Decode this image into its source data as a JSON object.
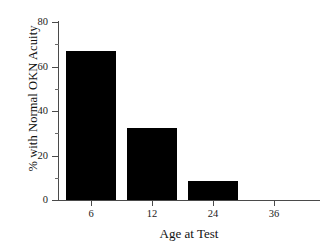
{
  "chart_data": {
    "type": "bar",
    "title": "",
    "subtitle": "",
    "xlabel": "Age at Test",
    "ylabel": "% with Normal OKN Acuity",
    "categories": [
      "6",
      "12",
      "24",
      "36"
    ],
    "values": [
      67,
      32.5,
      8.5,
      0
    ],
    "ylim": [
      0,
      80
    ],
    "ytick_major": [
      0,
      20,
      40,
      60,
      80
    ],
    "ytick_labels": [
      "0",
      "20",
      "40",
      "60",
      "80"
    ],
    "ytick_minor": [
      10,
      30,
      50,
      70
    ],
    "grid": false,
    "legend": "none",
    "bar_color": "#000000",
    "axis_color": "#4a4a4a",
    "series": [
      {
        "name": "% with Normal OKN Acuity",
        "values": [
          67,
          32.5,
          8.5,
          0
        ]
      }
    ],
    "annotations": []
  }
}
